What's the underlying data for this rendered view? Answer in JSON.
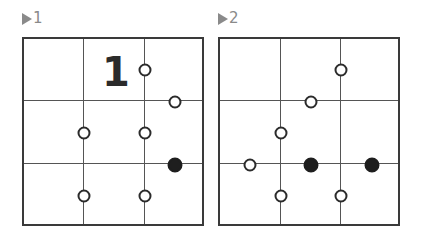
{
  "puzzles": [
    {
      "label": "1",
      "grid": {
        "cols": 3,
        "rows": 3
      },
      "clues": [
        {
          "text": "1",
          "cell_col": 1,
          "cell_row": 0
        }
      ],
      "pearls": [
        {
          "color": "white",
          "x": 121,
          "y": 31
        },
        {
          "color": "white",
          "x": 151,
          "y": 63
        },
        {
          "color": "white",
          "x": 60,
          "y": 94
        },
        {
          "color": "white",
          "x": 121,
          "y": 94
        },
        {
          "color": "black",
          "x": 151,
          "y": 126
        },
        {
          "color": "white",
          "x": 60,
          "y": 157
        },
        {
          "color": "white",
          "x": 121,
          "y": 157
        }
      ]
    },
    {
      "label": "2",
      "grid": {
        "cols": 3,
        "rows": 3
      },
      "clues": [],
      "pearls": [
        {
          "color": "white",
          "x": 121,
          "y": 31
        },
        {
          "color": "white",
          "x": 91,
          "y": 63
        },
        {
          "color": "white",
          "x": 61,
          "y": 94
        },
        {
          "color": "white",
          "x": 30,
          "y": 126
        },
        {
          "color": "black",
          "x": 91,
          "y": 126
        },
        {
          "color": "black",
          "x": 152,
          "y": 126
        },
        {
          "color": "white",
          "x": 61,
          "y": 157
        },
        {
          "color": "white",
          "x": 121,
          "y": 157
        }
      ]
    }
  ],
  "colors": {
    "label": "#8a8a8a",
    "border": "#3a3a3a",
    "gridline": "#555555",
    "pearl_outline": "#2b2b2b",
    "pearl_black": "#1e1e1e",
    "background": "#ffffff"
  }
}
